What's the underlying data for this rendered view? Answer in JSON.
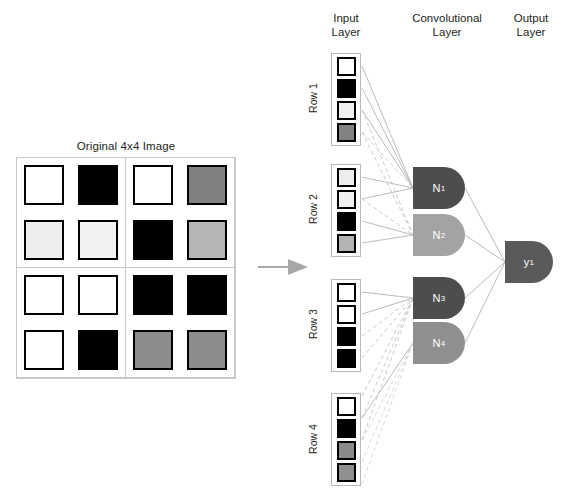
{
  "figure": {
    "type": "neural-network-diagram",
    "title_left": "Original 4x4 Image",
    "flow_arrow": "right-arrow-icon"
  },
  "original_image": {
    "label": "Original 4x4 Image",
    "grid_size": "4x4",
    "quadrant_split": true,
    "pixels": [
      [
        {
          "name": "pixel-r1c1",
          "shade": "white",
          "hex": "#ffffff"
        },
        {
          "name": "pixel-r1c2",
          "shade": "black",
          "hex": "#000000"
        },
        {
          "name": "pixel-r1c3",
          "shade": "white",
          "hex": "#ffffff"
        },
        {
          "name": "pixel-r1c4",
          "shade": "gray",
          "hex": "#808080"
        }
      ],
      [
        {
          "name": "pixel-r2c1",
          "shade": "light-gray",
          "hex": "#eeeeee"
        },
        {
          "name": "pixel-r2c2",
          "shade": "light-gray",
          "hex": "#f2f2f2"
        },
        {
          "name": "pixel-r2c3",
          "shade": "black",
          "hex": "#000000"
        },
        {
          "name": "pixel-r2c4",
          "shade": "light-gray",
          "hex": "#b5b5b5"
        }
      ],
      [
        {
          "name": "pixel-r3c1",
          "shade": "white",
          "hex": "#ffffff"
        },
        {
          "name": "pixel-r3c2",
          "shade": "white",
          "hex": "#ffffff"
        },
        {
          "name": "pixel-r3c3",
          "shade": "black",
          "hex": "#000000"
        },
        {
          "name": "pixel-r3c4",
          "shade": "black",
          "hex": "#000000"
        }
      ],
      [
        {
          "name": "pixel-r4c1",
          "shade": "white",
          "hex": "#ffffff"
        },
        {
          "name": "pixel-r4c2",
          "shade": "black",
          "hex": "#000000"
        },
        {
          "name": "pixel-r4c3",
          "shade": "gray",
          "hex": "#8c8c8c"
        },
        {
          "name": "pixel-r4c4",
          "shade": "gray",
          "hex": "#8c8c8c"
        }
      ]
    ]
  },
  "headers": {
    "input": "Input\nLayer",
    "convolutional": "Convolutional\nLayer",
    "output": "Output\nLayer"
  },
  "input_layer": {
    "rows": [
      {
        "label": "Row 1",
        "cells": [
          {
            "shade": "white",
            "hex": "#ffffff"
          },
          {
            "shade": "black",
            "hex": "#000000"
          },
          {
            "shade": "light-gray",
            "hex": "#efefef"
          },
          {
            "shade": "gray",
            "hex": "#828282"
          }
        ]
      },
      {
        "label": "Row 2",
        "cells": [
          {
            "shade": "light-gray",
            "hex": "#ededed"
          },
          {
            "shade": "light-gray",
            "hex": "#f2f2f2"
          },
          {
            "shade": "black",
            "hex": "#000000"
          },
          {
            "shade": "light-gray",
            "hex": "#b4b4b4"
          }
        ]
      },
      {
        "label": "Row 3",
        "cells": [
          {
            "shade": "white",
            "hex": "#ffffff"
          },
          {
            "shade": "white",
            "hex": "#ffffff"
          },
          {
            "shade": "black",
            "hex": "#000000"
          },
          {
            "shade": "black",
            "hex": "#000000"
          }
        ]
      },
      {
        "label": "Row 4",
        "cells": [
          {
            "shade": "white",
            "hex": "#ffffff"
          },
          {
            "shade": "black",
            "hex": "#000000"
          },
          {
            "shade": "gray",
            "hex": "#8a8a8a"
          },
          {
            "shade": "gray",
            "hex": "#8f8f8f"
          }
        ]
      }
    ]
  },
  "conv_layer": {
    "neurons": [
      {
        "id": "N1",
        "label": "N",
        "sub": "1",
        "hex": "#4d4d4d"
      },
      {
        "id": "N2",
        "label": "N",
        "sub": "2",
        "hex": "#a3a3a3"
      },
      {
        "id": "N3",
        "label": "N",
        "sub": "3",
        "hex": "#4d4d4d"
      },
      {
        "id": "N4",
        "label": "N",
        "sub": "4",
        "hex": "#8f8f8f"
      }
    ]
  },
  "output_layer": {
    "nodes": [
      {
        "id": "y1",
        "label": "y",
        "sub": "1",
        "hex": "#5a5a5a"
      }
    ]
  },
  "colors": {
    "edge_solid": "#b0b0b0",
    "edge_dashed": "#c0c0c0",
    "group_border": "#b8b8b8",
    "frame": "#c9c9c9",
    "arrow": "#a8a8a8",
    "text": "#231f20"
  }
}
